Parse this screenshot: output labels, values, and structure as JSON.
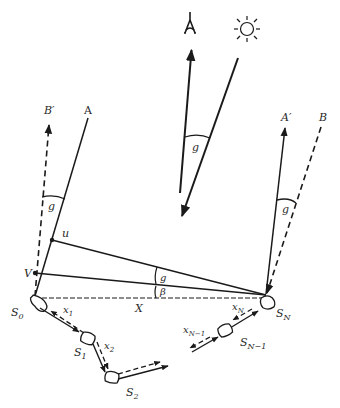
{
  "diagram": {
    "icons": {
      "landmark": "tower-icon",
      "sun": "sun-icon"
    },
    "top": {
      "angle_label": "g"
    },
    "left": {
      "label_A": "A",
      "label_B_prime": "B′",
      "angle_label": "g",
      "point_u": "u",
      "point_V": "V",
      "start_label": "S",
      "start_sub": "0"
    },
    "right": {
      "label_A_prime": "A′",
      "label_B": "B",
      "angle_label": "g",
      "end_label": "S",
      "end_sub": "N"
    },
    "center": {
      "angle_g": "g",
      "angle_beta": "β",
      "vector_X": "X"
    },
    "path": {
      "x1": "x",
      "x1_sub": "1",
      "x2": "x",
      "x2_sub": "2",
      "xN": "x",
      "xN_sub": "N",
      "xN1": "x",
      "xN1_sub": "N−1",
      "S1": "S",
      "S1_sub": "1",
      "S2": "S",
      "S2_sub": "2",
      "SN1": "S",
      "SN1_sub": "N−1"
    }
  }
}
